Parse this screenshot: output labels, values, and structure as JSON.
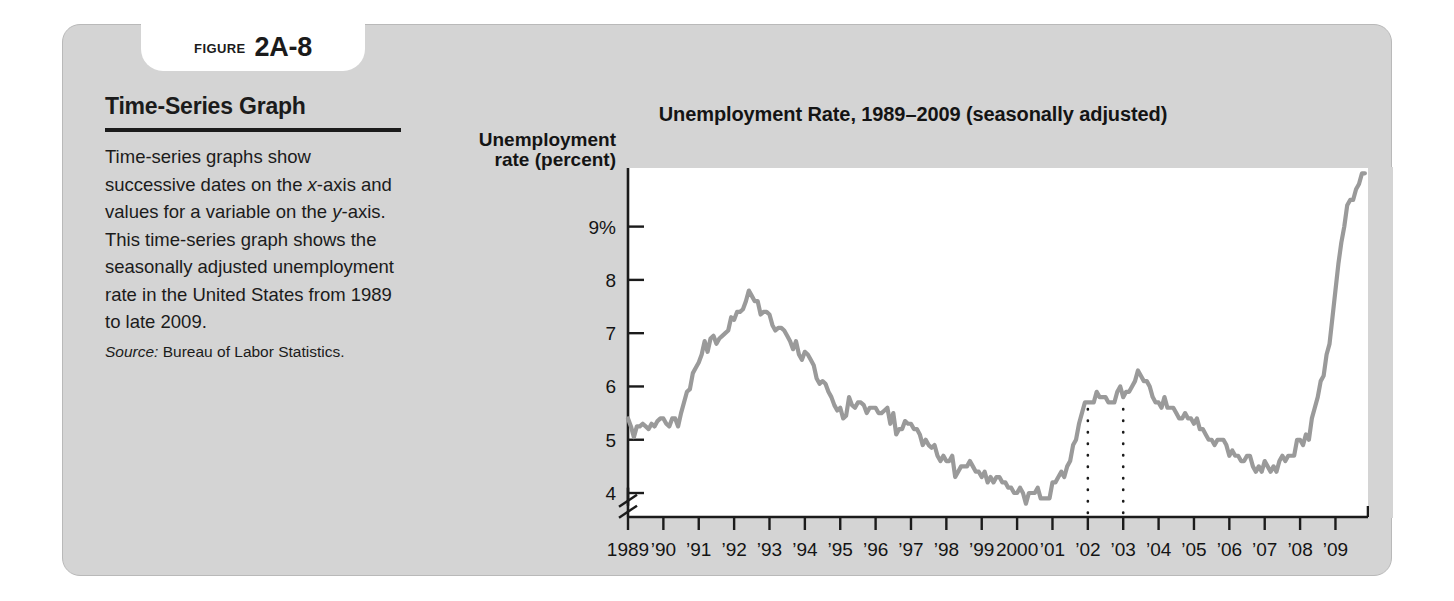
{
  "figure": {
    "label": "FIGURE",
    "number": "2A-8"
  },
  "sidebar": {
    "title": "Time-Series Graph",
    "body_parts": [
      {
        "text": "Time-series graphs show successive dates on the ",
        "italic": false
      },
      {
        "text": "x",
        "italic": true
      },
      {
        "text": "-axis and values for a variable on the ",
        "italic": false
      },
      {
        "text": "y",
        "italic": true
      },
      {
        "text": "-axis. This time-series graph shows the seasonally adjusted unemployment rate in the United States from 1989 to late 2009.",
        "italic": false
      }
    ],
    "source_label": "Source:",
    "source_text": "Bureau of Labor Statistics."
  },
  "chart_data": {
    "type": "line",
    "title": "Unemployment Rate, 1989–2009 (seasonally adjusted)",
    "xlabel": "Year",
    "ylabel": "Unemployment rate (percent)",
    "ylabel_line1": "Unemployment",
    "ylabel_line2": "rate (percent)",
    "ytick_labels": [
      "9%",
      "8",
      "7",
      "6",
      "5",
      "4"
    ],
    "ytick_values": [
      9,
      8,
      7,
      6,
      5,
      4
    ],
    "ylim": [
      3.55,
      10.1
    ],
    "axis_break": true,
    "axis_break_at": 3.8,
    "grid": false,
    "legend": null,
    "line_color": "#9a9a9a",
    "xtick_labels": [
      "1989",
      "’90",
      "’91",
      "’92",
      "’93",
      "’94",
      "’95",
      "’96",
      "’97",
      "’98",
      "’99",
      "2000",
      "’01",
      "’02",
      "’03",
      "’04",
      "’05",
      "’06",
      "’07",
      "’08",
      "’09"
    ],
    "xtick_values": [
      1989,
      1990,
      1991,
      1992,
      1993,
      1994,
      1995,
      1996,
      1997,
      1998,
      1999,
      2000,
      2001,
      2002,
      2003,
      2004,
      2005,
      2006,
      2007,
      2008,
      2009
    ],
    "xlim": [
      1989,
      2009.92
    ],
    "annotations": [
      {
        "type": "vertical-dotted-line",
        "x": 2002,
        "label": "recession-marker-2002"
      },
      {
        "type": "vertical-dotted-line",
        "x": 2003,
        "label": "recession-marker-2003"
      }
    ],
    "series": [
      {
        "name": "Unemployment rate",
        "x_start": 1989.0,
        "x_step": 0.08333,
        "values": [
          5.4,
          5.25,
          5.05,
          5.25,
          5.25,
          5.3,
          5.25,
          5.2,
          5.3,
          5.25,
          5.35,
          5.4,
          5.4,
          5.3,
          5.25,
          5.4,
          5.4,
          5.25,
          5.5,
          5.7,
          5.9,
          5.95,
          6.25,
          6.35,
          6.45,
          6.6,
          6.85,
          6.65,
          6.9,
          6.95,
          6.8,
          6.9,
          6.95,
          7.0,
          7.05,
          7.3,
          7.25,
          7.4,
          7.4,
          7.45,
          7.6,
          7.8,
          7.7,
          7.6,
          7.6,
          7.35,
          7.4,
          7.4,
          7.35,
          7.15,
          7.05,
          7.1,
          7.1,
          7.05,
          6.95,
          6.85,
          6.7,
          6.85,
          6.6,
          6.5,
          6.65,
          6.6,
          6.5,
          6.4,
          6.15,
          6.05,
          6.1,
          6.05,
          5.9,
          5.8,
          5.65,
          5.55,
          5.6,
          5.4,
          5.45,
          5.8,
          5.65,
          5.6,
          5.7,
          5.7,
          5.65,
          5.5,
          5.6,
          5.6,
          5.6,
          5.5,
          5.5,
          5.55,
          5.6,
          5.3,
          5.5,
          5.1,
          5.2,
          5.2,
          5.35,
          5.3,
          5.3,
          5.2,
          5.2,
          5.1,
          4.9,
          5.0,
          4.9,
          4.85,
          4.9,
          4.7,
          4.6,
          4.7,
          4.6,
          4.6,
          4.7,
          4.3,
          4.4,
          4.5,
          4.5,
          4.5,
          4.6,
          4.5,
          4.4,
          4.4,
          4.3,
          4.4,
          4.2,
          4.3,
          4.2,
          4.3,
          4.3,
          4.2,
          4.2,
          4.1,
          4.1,
          4.0,
          4.0,
          4.1,
          4.0,
          3.8,
          4.0,
          4.0,
          4.0,
          4.1,
          3.9,
          3.9,
          3.9,
          3.9,
          4.2,
          4.2,
          4.3,
          4.4,
          4.3,
          4.5,
          4.6,
          4.9,
          5.0,
          5.3,
          5.5,
          5.7,
          5.7,
          5.7,
          5.7,
          5.9,
          5.8,
          5.8,
          5.8,
          5.7,
          5.7,
          5.7,
          5.9,
          6.0,
          5.8,
          5.9,
          5.9,
          6.0,
          6.1,
          6.3,
          6.2,
          6.1,
          6.1,
          6.0,
          5.8,
          5.7,
          5.7,
          5.6,
          5.8,
          5.6,
          5.6,
          5.6,
          5.5,
          5.4,
          5.4,
          5.5,
          5.4,
          5.4,
          5.3,
          5.4,
          5.2,
          5.2,
          5.1,
          5.0,
          5.0,
          4.9,
          5.0,
          5.0,
          5.0,
          4.9,
          4.7,
          4.8,
          4.7,
          4.7,
          4.6,
          4.6,
          4.7,
          4.7,
          4.5,
          4.4,
          4.5,
          4.4,
          4.6,
          4.5,
          4.4,
          4.5,
          4.4,
          4.6,
          4.7,
          4.6,
          4.7,
          4.7,
          4.7,
          5.0,
          5.0,
          4.9,
          5.1,
          5.0,
          5.4,
          5.6,
          5.8,
          6.1,
          6.2,
          6.6,
          6.8,
          7.3,
          7.8,
          8.3,
          8.7,
          9.0,
          9.4,
          9.5,
          9.5,
          9.7,
          9.8,
          10.0,
          10.0
        ]
      }
    ]
  }
}
